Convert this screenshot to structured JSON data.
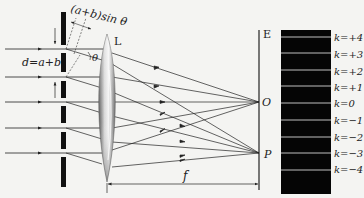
{
  "diagram": {
    "labels": {
      "path_difference": "(a+b)sin θ",
      "grating_constant": "d=a+b",
      "angle": "θ",
      "lens": "L",
      "screen": "E",
      "center_point": "O",
      "off_point": "P",
      "focal_length": "f"
    },
    "orders": [
      {
        "label": "k=+4"
      },
      {
        "label": "k=+3"
      },
      {
        "label": "k=+2"
      },
      {
        "label": "k=+1"
      },
      {
        "label": "k=0"
      },
      {
        "label": "k=−1"
      },
      {
        "label": "k=−2"
      },
      {
        "label": "k=−3"
      },
      {
        "label": "k=−4"
      }
    ],
    "colors": {
      "ink": "#222222",
      "background": "#f4f4f2",
      "fringe_panel": "#050505",
      "fringe_line": "#bfbfbf"
    }
  }
}
